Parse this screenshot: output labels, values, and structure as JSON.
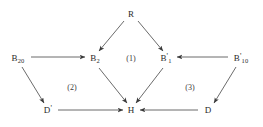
{
  "figure": {
    "type": "commutative-diagram",
    "background_color": "#ffffff",
    "ink_color": "#3a3a3a",
    "width": 263,
    "height": 127
  },
  "nodes": [
    {
      "id": "R",
      "label": "R",
      "sub": "",
      "prime": "",
      "x": 131,
      "y": 14
    },
    {
      "id": "B20",
      "label": "B",
      "sub": "20",
      "prime": "",
      "x": 18,
      "y": 59
    },
    {
      "id": "B2",
      "label": "B",
      "sub": "2",
      "prime": "",
      "x": 95,
      "y": 59
    },
    {
      "id": "B1p",
      "label": "B",
      "sub": "1",
      "prime": "'",
      "x": 166,
      "y": 59
    },
    {
      "id": "B10p",
      "label": "B",
      "sub": "10",
      "prime": "'",
      "x": 241,
      "y": 59
    },
    {
      "id": "Dp",
      "label": "D",
      "sub": "",
      "prime": "'",
      "x": 48,
      "y": 110
    },
    {
      "id": "H",
      "label": "H",
      "sub": "",
      "prime": "",
      "x": 131,
      "y": 110
    },
    {
      "id": "D",
      "label": "D",
      "sub": "",
      "prime": "",
      "x": 208,
      "y": 110
    }
  ],
  "region_labels": [
    {
      "id": "region-1",
      "text": "(1)",
      "x": 131,
      "y": 59
    },
    {
      "id": "region-2",
      "text": "(2)",
      "x": 72,
      "y": 88
    },
    {
      "id": "region-3",
      "text": "(3)",
      "x": 190,
      "y": 88
    }
  ],
  "edges": [
    {
      "id": "R-to-B2",
      "from": "R",
      "to": "B2",
      "x1": 124,
      "y1": 21,
      "x2": 99,
      "y2": 51
    },
    {
      "id": "R-to-B1p",
      "from": "R",
      "to": "B1p",
      "x1": 138,
      "y1": 21,
      "x2": 163,
      "y2": 51
    },
    {
      "id": "B20-to-B2",
      "from": "B20",
      "to": "B2",
      "x1": 31,
      "y1": 57,
      "x2": 85,
      "y2": 57
    },
    {
      "id": "B10p-to-B1p",
      "from": "B10p",
      "to": "B1p",
      "x1": 228,
      "y1": 57,
      "x2": 177,
      "y2": 57
    },
    {
      "id": "B20-to-Dp",
      "from": "B20",
      "to": "Dp",
      "x1": 22,
      "y1": 67,
      "x2": 44,
      "y2": 103
    },
    {
      "id": "B10p-to-D",
      "from": "B10p",
      "to": "D",
      "x1": 236,
      "y1": 67,
      "x2": 214,
      "y2": 103
    },
    {
      "id": "B2-to-H",
      "from": "B2",
      "to": "H",
      "x1": 99,
      "y1": 68,
      "x2": 127,
      "y2": 103
    },
    {
      "id": "B1p-to-H",
      "from": "B1p",
      "to": "H",
      "x1": 163,
      "y1": 68,
      "x2": 136,
      "y2": 103
    },
    {
      "id": "Dp-to-H",
      "from": "Dp",
      "to": "H",
      "x1": 58,
      "y1": 110,
      "x2": 123,
      "y2": 110
    },
    {
      "id": "D-to-H",
      "from": "D",
      "to": "H",
      "x1": 198,
      "y1": 110,
      "x2": 140,
      "y2": 110
    }
  ]
}
